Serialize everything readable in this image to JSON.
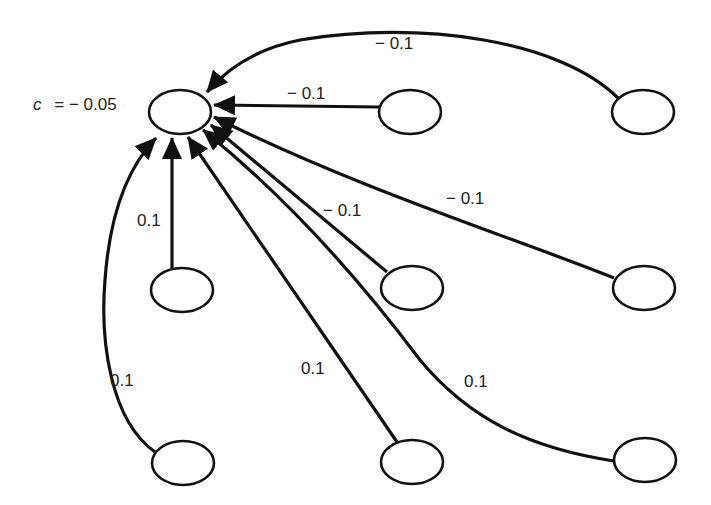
{
  "diagram": {
    "title": "",
    "target_node": {
      "id": "target",
      "label": "c = − 0.05",
      "label_var": "c",
      "label_eq": "= − 0.05",
      "cx": 180,
      "cy": 112,
      "rx": 31,
      "ry": 22
    },
    "nodes": [
      {
        "id": "n_top_mid",
        "cx": 410,
        "cy": 112,
        "rx": 31,
        "ry": 22
      },
      {
        "id": "n_top_right",
        "cx": 643,
        "cy": 112,
        "rx": 31,
        "ry": 22
      },
      {
        "id": "n_mid_left",
        "cx": 182,
        "cy": 290,
        "rx": 31,
        "ry": 22
      },
      {
        "id": "n_mid_mid",
        "cx": 412,
        "cy": 288,
        "rx": 31,
        "ry": 22
      },
      {
        "id": "n_mid_right",
        "cx": 644,
        "cy": 288,
        "rx": 31,
        "ry": 22
      },
      {
        "id": "n_bot_left",
        "cx": 183,
        "cy": 463,
        "rx": 31,
        "ry": 22
      },
      {
        "id": "n_bot_mid",
        "cx": 412,
        "cy": 462,
        "rx": 31,
        "ry": 22
      },
      {
        "id": "n_bot_right",
        "cx": 645,
        "cy": 460,
        "rx": 31,
        "ry": 22
      }
    ],
    "edges": [
      {
        "from": "n_top_right",
        "to": "target",
        "weight": "− 0.1",
        "label_x": 375,
        "label_y": 49
      },
      {
        "from": "n_top_mid",
        "to": "target",
        "weight": "− 0.1",
        "label_x": 287,
        "label_y": 99
      },
      {
        "from": "n_mid_right",
        "to": "target",
        "weight": "− 0.1",
        "label_x": 446,
        "label_y": 204
      },
      {
        "from": "n_mid_mid",
        "to": "target",
        "weight": "− 0.1",
        "label_x": 323,
        "label_y": 216
      },
      {
        "from": "n_mid_left",
        "to": "target",
        "weight": "0.1",
        "label_x": 137,
        "label_y": 226
      },
      {
        "from": "n_bot_left",
        "to": "target",
        "weight": "0.1",
        "label_x": 110,
        "label_y": 386
      },
      {
        "from": "n_bot_mid",
        "to": "target",
        "weight": "0.1",
        "label_x": 301,
        "label_y": 374
      },
      {
        "from": "n_bot_right",
        "to": "target",
        "weight": "0.1",
        "label_x": 464,
        "label_y": 387
      }
    ],
    "colors": {
      "stroke": "#111111",
      "background": "#ffffff",
      "text": "#222222"
    }
  }
}
